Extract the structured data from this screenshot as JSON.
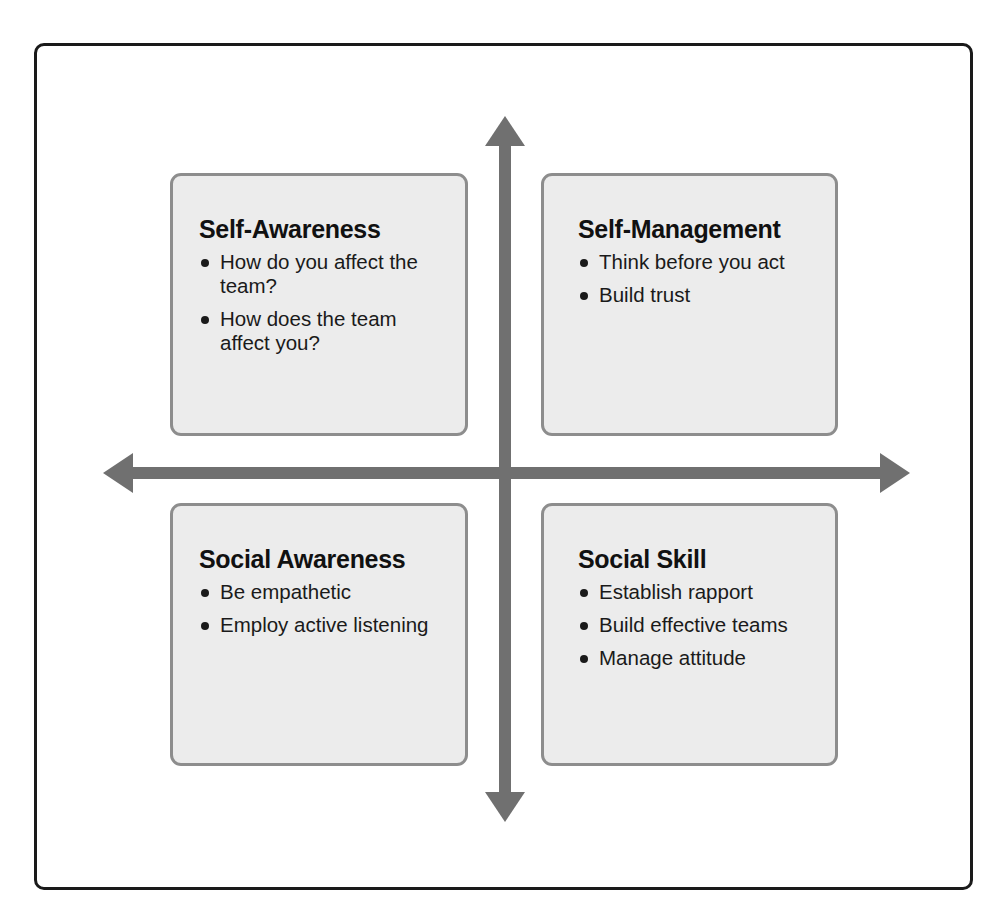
{
  "diagram": {
    "type": "four-quadrant matrix",
    "colors": {
      "frame_border": "#1a1a1a",
      "box_fill": "#ececec",
      "box_border": "#8d8d8d",
      "arrow": "#707070",
      "text": "#141414"
    },
    "quadrants": [
      {
        "position": "top-left",
        "title": "Self-Awareness",
        "bullets": [
          "How do you affect the team?",
          "How does the team affect you?"
        ]
      },
      {
        "position": "top-right",
        "title": "Self-Management",
        "bullets": [
          "Think before you act",
          "Build trust"
        ]
      },
      {
        "position": "bottom-left",
        "title": "Social Awareness",
        "bullets": [
          "Be empathetic",
          "Employ active listening"
        ]
      },
      {
        "position": "bottom-right",
        "title": "Social Skill",
        "bullets": [
          "Establish rapport",
          "Build effective teams",
          "Manage attitude"
        ]
      }
    ],
    "axes": {
      "vertical": "double-headed arrow",
      "horizontal": "double-headed arrow"
    }
  }
}
